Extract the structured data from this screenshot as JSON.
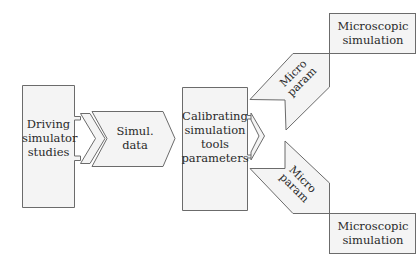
{
  "diagram": {
    "type": "flowchart",
    "colors": {
      "fill": "#f4f4f4",
      "stroke": "#6b6b6b",
      "text": "#2a2a2a",
      "background": "#ffffff"
    },
    "nodes": [
      {
        "id": "driving",
        "label_lines": [
          "Driving",
          "simulator",
          "studies"
        ]
      },
      {
        "id": "simul_data",
        "shape": "arrow",
        "label_lines": [
          "Simul.",
          "data"
        ]
      },
      {
        "id": "calibrating",
        "label_lines": [
          "Calibrating",
          "simulation",
          "tools",
          "parameters"
        ]
      },
      {
        "id": "micro_param_upper",
        "shape": "arrow",
        "label_lines": [
          "Micro",
          "param"
        ]
      },
      {
        "id": "micro_param_lower",
        "shape": "arrow",
        "label_lines": [
          "Micro",
          "param"
        ]
      },
      {
        "id": "micro_sim_top",
        "label_lines": [
          "Microscopic",
          "simulation"
        ]
      },
      {
        "id": "micro_sim_bottom",
        "label_lines": [
          "Microscopic",
          "simulation"
        ]
      }
    ],
    "edges": [
      {
        "from": "driving",
        "to": "simul_data"
      },
      {
        "from": "simul_data",
        "to": "calibrating"
      },
      {
        "from": "calibrating",
        "to": "micro_param_upper"
      },
      {
        "from": "calibrating",
        "to": "micro_param_lower"
      },
      {
        "from": "micro_param_upper",
        "to": "micro_sim_top"
      },
      {
        "from": "micro_param_lower",
        "to": "micro_sim_bottom"
      }
    ]
  }
}
